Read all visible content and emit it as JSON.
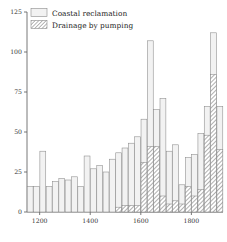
{
  "chart_data": {
    "type": "bar",
    "title": "",
    "subtitle": "",
    "xlabel": "",
    "ylabel": "",
    "stacked": true,
    "grid": false,
    "legend_position": "top-left",
    "xlim": [
      1150,
      1925
    ],
    "ylim": [
      0,
      125
    ],
    "bin_width_years": 25,
    "x_ticks": [
      1200,
      1400,
      1600,
      1800
    ],
    "x_tick_labels": [
      "1200",
      "1400",
      "1600",
      "1800"
    ],
    "y_ticks": [
      0,
      25,
      50,
      75,
      100,
      125
    ],
    "y_tick_labels": [
      "0",
      "25",
      "50",
      "75",
      "100",
      "125"
    ],
    "categories": [
      1150,
      1175,
      1200,
      1225,
      1250,
      1275,
      1300,
      1325,
      1350,
      1375,
      1400,
      1425,
      1450,
      1475,
      1500,
      1525,
      1550,
      1575,
      1600,
      1625,
      1650,
      1675,
      1700,
      1725,
      1750,
      1775,
      1800,
      1825,
      1850,
      1875,
      1900
    ],
    "series": [
      {
        "name": "Coastal reclamation",
        "color": "#f2f2f2",
        "pattern": "solid",
        "values": [
          16,
          16,
          38,
          16,
          19,
          21,
          20,
          22,
          16,
          35,
          27,
          29,
          25,
          33,
          37,
          40,
          43,
          47,
          58,
          107,
          64,
          71,
          38,
          42,
          17,
          34,
          36,
          49,
          66,
          112,
          66
        ]
      },
      {
        "name": "Drainage by pumping",
        "color": "#ffffff",
        "pattern": "diagonal-hatch",
        "values": [
          0,
          0,
          0,
          0,
          0,
          0,
          0,
          0,
          0,
          0,
          0,
          0,
          0,
          0,
          3,
          4,
          4,
          4,
          31,
          41,
          41,
          10,
          5,
          7,
          5,
          16,
          10,
          14,
          48,
          86,
          39
        ]
      }
    ]
  },
  "legend": {
    "items": [
      {
        "label": "Coastal reclamation",
        "swatch": "plain-box"
      },
      {
        "label": "Drainage by pumping",
        "swatch": "hatched-box"
      }
    ]
  },
  "colors": {
    "bar_fill": "#f2f2f2",
    "bar_stroke": "#8a8a8a",
    "axis": "#555555",
    "text": "#222222",
    "background": "#ffffff"
  }
}
